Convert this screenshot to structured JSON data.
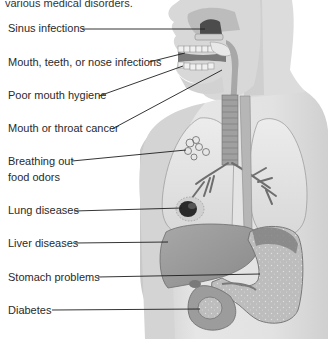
{
  "intro_text": "various medical disorders.",
  "labels": [
    {
      "id": "sinus",
      "text": "Sinus infections",
      "top": 22
    },
    {
      "id": "mouth-teeth-nose",
      "text": "Mouth, teeth, or nose infections",
      "top": 56
    },
    {
      "id": "hygiene",
      "text": "Poor mouth hygiene",
      "top": 89
    },
    {
      "id": "cancer",
      "text": "Mouth or throat cancer",
      "top": 122
    },
    {
      "id": "breathing-1",
      "text": "Breathing out",
      "top": 155
    },
    {
      "id": "breathing-2",
      "text": "food odors",
      "top": 171
    },
    {
      "id": "lung",
      "text": "Lung diseases",
      "top": 204
    },
    {
      "id": "liver",
      "text": "Liver diseases",
      "top": 237
    },
    {
      "id": "stomach",
      "text": "Stomach problems",
      "top": 271
    },
    {
      "id": "diabetes",
      "text": "Diabetes",
      "top": 304
    }
  ],
  "illustration": {
    "subject": "human-torso-anatomy",
    "organs": [
      "sinus",
      "mouth",
      "teeth",
      "throat",
      "trachea",
      "esophagus",
      "lungs",
      "liver",
      "stomach",
      "pancreas"
    ]
  },
  "colors": {
    "skin": "#e4e4e4",
    "skin_shadow": "#c4c4c4",
    "organ": "#b8b8b8",
    "organ_dark": "#6a6a6a",
    "line": "#222222"
  }
}
